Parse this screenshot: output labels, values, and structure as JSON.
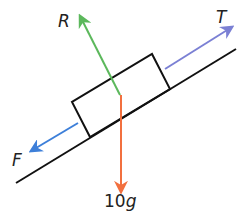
{
  "diagram": {
    "type": "free-body diagram on inclined plane",
    "forces": {
      "R": {
        "label": "R",
        "color": "#5cb85c",
        "direction": "normal reaction, perpendicular to slope"
      },
      "T": {
        "label": "T",
        "color": "#7b80d4",
        "direction": "tension, up the slope"
      },
      "F": {
        "label": "F",
        "color": "#3d7fd9",
        "direction": "friction, down the slope"
      },
      "W": {
        "label_num": "10",
        "label_var": "g",
        "color": "#f2703f",
        "direction": "weight, vertically down"
      }
    },
    "colors": {
      "line": "#111111",
      "background": "#ffffff"
    }
  }
}
